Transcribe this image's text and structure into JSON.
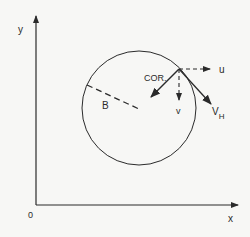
{
  "diagram": {
    "axes": {
      "y_label": "y",
      "x_label": "x",
      "origin_label": "0"
    },
    "circle": {
      "radius_label": "B"
    },
    "vectors": {
      "cor_label": "COR.",
      "u_label": "u",
      "v_label": "v",
      "vh_label": "V",
      "vh_subscript": "H"
    },
    "colors": {
      "ink": "#2a2a2a",
      "background": "#f7f7f5"
    }
  }
}
